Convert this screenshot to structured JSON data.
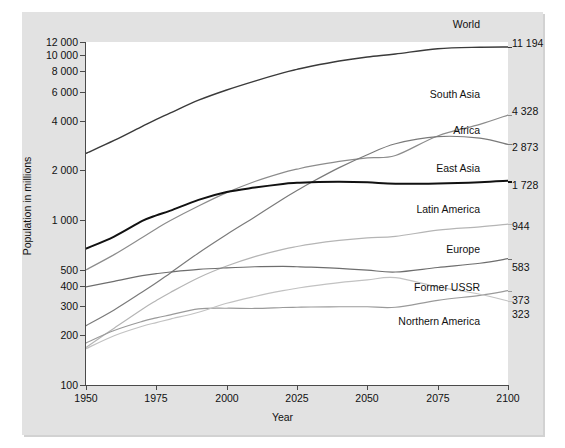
{
  "chart_data": {
    "type": "line",
    "title": "",
    "xlabel": "Year",
    "ylabel": "Population in millions",
    "xlim": [
      1950,
      2100
    ],
    "ylim": [
      100,
      12000
    ],
    "yscale": "log",
    "grid": false,
    "legend_position": "inline-right",
    "xticks": [
      "1950",
      "1975",
      "2000",
      "2025",
      "2050",
      "2075",
      "2100"
    ],
    "xtick_values": [
      1950,
      1975,
      2000,
      2025,
      2050,
      2075,
      2100
    ],
    "yticks": [
      "100",
      "200",
      "300",
      "400",
      "500",
      "1 000",
      "2 000",
      "4 000",
      "6 000",
      "8 000",
      "10 000",
      "12 000"
    ],
    "ytick_values": [
      100,
      200,
      300,
      400,
      500,
      1000,
      2000,
      4000,
      6000,
      8000,
      10000,
      12000
    ],
    "x": [
      1950,
      1960,
      1970,
      1975,
      1980,
      1990,
      2000,
      2010,
      2020,
      2025,
      2030,
      2040,
      2050,
      2060,
      2075,
      2090,
      2100
    ],
    "series": [
      {
        "name": "World",
        "end_label": "11 194",
        "end_value": 11194,
        "color": "#3a3a3a",
        "width": 1.4,
        "values": [
          2536,
          3035,
          3700,
          4079,
          4458,
          5327,
          6143,
          6957,
          7795,
          8184,
          8549,
          9199,
          9735,
          10152,
          10703,
          11051,
          11194
        ]
      },
      {
        "name": "South Asia",
        "end_label": "4 328",
        "end_value": 4328,
        "color": "#8c8c8c",
        "width": 1.2,
        "values": [
          499,
          617,
          784,
          886,
          993,
          1216,
          1465,
          1713,
          1940,
          2034,
          2122,
          2270,
          2382,
          2462,
          2547,
          2575,
          4328
        ]
      },
      {
        "name": "Africa",
        "end_label": "2 873",
        "end_value": 2873,
        "color": "#7a7a7a",
        "width": 1.2,
        "values": [
          229,
          285,
          366,
          416,
          478,
          632,
          818,
          1044,
          1341,
          1508,
          1688,
          2077,
          2489,
          2900,
          3500,
          4100,
          2873
        ]
      },
      {
        "name": "East Asia",
        "end_label": "1 728",
        "end_value": 1728,
        "color": "#111111",
        "width": 2.0,
        "values": [
          671,
          794,
          987,
          1068,
          1140,
          1325,
          1478,
          1574,
          1656,
          1680,
          1696,
          1705,
          1693,
          1662,
          1620,
          1600,
          1728
        ]
      },
      {
        "name": "Latin America",
        "end_label": "944",
        "end_value": 944,
        "color": "#b5b5b5",
        "width": 1.2,
        "values": [
          169,
          221,
          288,
          325,
          364,
          447,
          526,
          600,
          664,
          691,
          715,
          752,
          779,
          796,
          810,
          812,
          944
        ]
      },
      {
        "name": "Europe",
        "end_label": "583",
        "end_value": 583,
        "color": "#6e6e6e",
        "width": 1.2,
        "values": [
          393,
          425,
          460,
          473,
          484,
          502,
          513,
          521,
          523,
          521,
          518,
          509,
          497,
          484,
          466,
          452,
          583
        ]
      },
      {
        "name": "Former USSR",
        "end_label": "373",
        "end_value": 373,
        "color": "#9a9a9a",
        "width": 1.2,
        "values": [
          180,
          214,
          243,
          255,
          266,
          289,
          292,
          291,
          295,
          296,
          297,
          298,
          298,
          296,
          292,
          288,
          373
        ]
      },
      {
        "name": "Northern America",
        "end_label": "323",
        "end_value": 323,
        "color": "#c2c2c2",
        "width": 1.2,
        "values": [
          166,
          199,
          227,
          239,
          251,
          276,
          313,
          344,
          373,
          386,
          398,
          418,
          434,
          447,
          462,
          471,
          323
        ]
      }
    ]
  },
  "labels": {
    "world": "World",
    "south_asia": "South Asia",
    "africa": "Africa",
    "east_asia": "East Asia",
    "latin_america": "Latin America",
    "europe": "Europe",
    "former_ussr": "Former USSR",
    "northern_america": "Northern America"
  },
  "end_values": {
    "world": "11 194",
    "south_asia": "4 328",
    "africa": "2 873",
    "east_asia": "1 728",
    "latin_america": "944",
    "europe": "583",
    "former_ussr": "373",
    "northern_america": "323"
  },
  "axes": {
    "x_title": "Year",
    "y_title": "Population in millions"
  },
  "colors": {
    "card_bg": "#e2e2e2",
    "plot_bg": "#ffffff",
    "axis": "#4a4a4a",
    "text": "#111111"
  }
}
